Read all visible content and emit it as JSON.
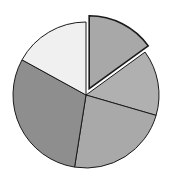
{
  "chart_data": {
    "type": "pie",
    "title": "",
    "categories": [
      "Slice 1",
      "Slice 2",
      "Slice 3",
      "Slice 4",
      "Slice 5"
    ],
    "values": [
      15,
      14.5,
      23,
      30.5,
      17
    ],
    "exploded": [
      true,
      false,
      false,
      false,
      false
    ],
    "colors": [
      "#a8a8a8",
      "#b0b0b0",
      "#a9a9a9",
      "#8e8e8e",
      "#f0f0f0"
    ],
    "start_angle_deg": 0,
    "direction": "clockwise",
    "legend": "none",
    "labels": "none"
  },
  "layout": {
    "cx": 86,
    "cy": 95,
    "r": 73,
    "explode_offset": 7,
    "stroke": "#1a1a1a"
  }
}
